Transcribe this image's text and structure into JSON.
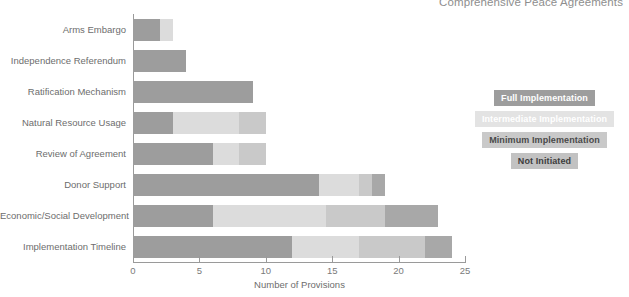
{
  "chart_data": {
    "type": "bar",
    "orientation": "horizontal",
    "stacked": true,
    "title": "Comprehensive Peace Agreements",
    "xlabel": "Number of Provisions",
    "ylabel": "",
    "xlim": [
      0,
      25
    ],
    "xticks": [
      0,
      5,
      10,
      15,
      20,
      25
    ],
    "grid": false,
    "legend_position": "right",
    "categories": [
      "Arms Embargo",
      "Independence Referendum",
      "Ratification Mechanism",
      "Natural Resource Usage",
      "Review of Agreement",
      "Donor Support",
      "Economic/Social Development",
      "Implementation Timeline"
    ],
    "series": [
      {
        "name": "Full Implementation",
        "color": "#9d9d9d",
        "values": [
          2,
          4,
          9,
          3,
          6,
          14,
          6,
          12
        ]
      },
      {
        "name": "Intermediate Implementation",
        "color": "#dcdcdc",
        "values": [
          1,
          0,
          0,
          5,
          2,
          3,
          8.5,
          5
        ]
      },
      {
        "name": "Minimum Implementation",
        "color": "#c9c9c9",
        "values": [
          0,
          0,
          0,
          2,
          2,
          1,
          4.5,
          5
        ]
      },
      {
        "name": "Not Initiated",
        "color": "#a8a8a8",
        "values": [
          0,
          0,
          0,
          0,
          0,
          1,
          4,
          2
        ]
      }
    ],
    "totals": [
      3,
      4,
      9,
      10,
      10,
      19,
      23,
      24
    ]
  },
  "legend": {
    "items": [
      {
        "label": "Full Implementation",
        "bg": "#9d9d9d",
        "fg": "#ffffff"
      },
      {
        "label": "Intermediate Implementation",
        "bg": "#e3e3e3",
        "fg": "#ffffff"
      },
      {
        "label": "Minimum Implementation",
        "bg": "#c9c9c9",
        "fg": "#4a4a4a"
      },
      {
        "label": "Not Initiated",
        "bg": "#c2c2c2",
        "fg": "#3d3d3d"
      }
    ]
  }
}
